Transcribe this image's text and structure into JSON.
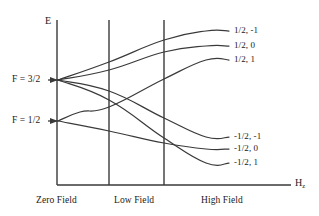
{
  "figure": {
    "axes": {
      "y_label": "E",
      "x_label_main": "H",
      "x_label_sub": "z"
    },
    "zero_field_levels": [
      {
        "label": "F = 3/2",
        "y": 80
      },
      {
        "label": "F = 1/2",
        "y": 121
      }
    ],
    "regions": [
      {
        "label": "Zero Field"
      },
      {
        "label": "Low Field"
      },
      {
        "label": "High Field"
      }
    ],
    "high_field_states": [
      {
        "label": "1/2, -1"
      },
      {
        "label": "1/2, 0"
      },
      {
        "label": "1/2, 1"
      },
      {
        "label": "-1/2, -1"
      },
      {
        "label": "-1/2, 0"
      },
      {
        "label": "-1/2, 1"
      }
    ],
    "colors": {
      "line": "#3a3a3a",
      "text": "#1a1a1a",
      "background": "#ffffff"
    }
  },
  "chart_data": {
    "type": "line",
    "xlabel": "Hz",
    "ylabel": "E",
    "grid": false,
    "legend_position": "right-inline",
    "axis_geometry": {
      "y_axis_x": 57,
      "x_axis_y": 185,
      "y_axis_top": 20,
      "x_axis_right": 291,
      "divider_x": [
        109,
        164
      ],
      "plateau_x": 206,
      "line_end_x": 229
    },
    "zero_field_origins": [
      {
        "name": "F = 3/2",
        "x": 58,
        "y": 80
      },
      {
        "name": "F = 1/2",
        "x": 58,
        "y": 121
      }
    ],
    "series": [
      {
        "name": "1/2, -1",
        "origin": "F = 3/2",
        "path": [
          [
            58,
            80
          ],
          [
            109,
            62
          ],
          [
            164,
            40
          ],
          [
            206,
            31
          ],
          [
            229,
            31
          ]
        ],
        "end_y": 31
      },
      {
        "name": "1/2, 0",
        "origin": "F = 3/2",
        "path": [
          [
            58,
            80
          ],
          [
            109,
            70
          ],
          [
            164,
            52
          ],
          [
            206,
            46
          ],
          [
            229,
            46
          ]
        ],
        "end_y": 46
      },
      {
        "name": "1/2, 1",
        "origin": "F = 1/2",
        "path": [
          [
            58,
            121
          ],
          [
            80,
            112
          ],
          [
            109,
            107
          ],
          [
            164,
            79
          ],
          [
            206,
            60
          ],
          [
            229,
            60
          ]
        ],
        "end_y": 60
      },
      {
        "name": "-1/2, -1",
        "origin": "F = 3/2",
        "path": [
          [
            58,
            80
          ],
          [
            109,
            91
          ],
          [
            164,
            118
          ],
          [
            206,
            137
          ],
          [
            229,
            137
          ]
        ],
        "end_y": 137
      },
      {
        "name": "-1/2, 0",
        "origin": "F = 1/2",
        "path": [
          [
            58,
            121
          ],
          [
            109,
            131
          ],
          [
            164,
            143
          ],
          [
            206,
            149
          ],
          [
            229,
            149
          ]
        ],
        "end_y": 149
      },
      {
        "name": "-1/2, 1",
        "origin": "F = 3/2",
        "path": [
          [
            58,
            80
          ],
          [
            109,
            100
          ],
          [
            164,
            138
          ],
          [
            206,
            163
          ],
          [
            229,
            163
          ]
        ],
        "end_y": 163
      }
    ],
    "annotations": [
      {
        "text": "Zero Field",
        "x": 58,
        "y": 202
      },
      {
        "text": "Low Field",
        "x": 137,
        "y": 202
      },
      {
        "text": "High Field",
        "x": 225,
        "y": 202
      }
    ]
  }
}
